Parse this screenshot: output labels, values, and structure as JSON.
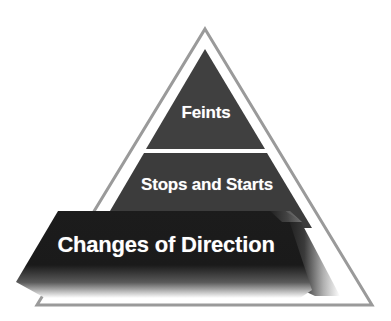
{
  "diagram": {
    "type": "pyramid",
    "levels": [
      {
        "label": "Feints",
        "position": "top",
        "color": "#404040"
      },
      {
        "label": "Stops and Starts",
        "position": "middle",
        "color": "#3c3c3c"
      },
      {
        "label": "Changes of Direction",
        "position": "bottom",
        "color": "#1a1a1a",
        "highlighted": true
      }
    ],
    "outline_color": "#9a9a9a",
    "text_color": "#ffffff",
    "background": "#ffffff"
  }
}
